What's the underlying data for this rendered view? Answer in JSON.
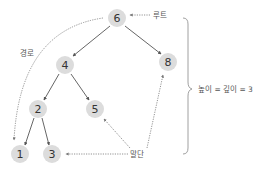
{
  "diagram": {
    "type": "binary-search-tree",
    "nodes": [
      {
        "id": "6",
        "label": "6",
        "x": 117,
        "y": 18
      },
      {
        "id": "4",
        "label": "4",
        "x": 65,
        "y": 65
      },
      {
        "id": "8",
        "label": "8",
        "x": 168,
        "y": 62
      },
      {
        "id": "2",
        "label": "2",
        "x": 38,
        "y": 109
      },
      {
        "id": "5",
        "label": "5",
        "x": 95,
        "y": 109
      },
      {
        "id": "1",
        "label": "1",
        "x": 20,
        "y": 154
      },
      {
        "id": "3",
        "label": "3",
        "x": 52,
        "y": 154
      }
    ],
    "edges": [
      {
        "from": "6",
        "to": "4"
      },
      {
        "from": "6",
        "to": "8"
      },
      {
        "from": "4",
        "to": "2"
      },
      {
        "from": "4",
        "to": "5"
      },
      {
        "from": "2",
        "to": "1"
      },
      {
        "from": "2",
        "to": "3"
      }
    ],
    "annotations": {
      "root_label": "루트",
      "path_label": "경로",
      "leaf_label": "말단",
      "height_label": "높이 = 깊이 = 3"
    },
    "colors": {
      "node_fill": "#dcdcdc",
      "edge": "#555555",
      "text": "#333333"
    }
  }
}
